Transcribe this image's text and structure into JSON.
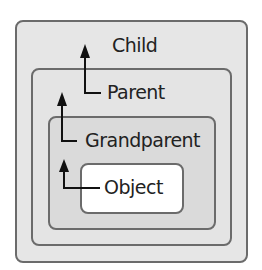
{
  "diagram": {
    "type": "nested-containment",
    "levels": [
      {
        "id": "child",
        "label": "Child"
      },
      {
        "id": "parent",
        "label": "Parent"
      },
      {
        "id": "grandparent",
        "label": "Grandparent"
      },
      {
        "id": "object",
        "label": "Object"
      }
    ],
    "arrows": [
      {
        "from": "Object",
        "to": "Grandparent"
      },
      {
        "from": "Grandparent",
        "to": "Parent"
      },
      {
        "from": "Parent",
        "to": "Child"
      }
    ],
    "colors": {
      "border": "#6b6b6b",
      "child_fill": "#e6e6e6",
      "parent_fill": "#e4e4e4",
      "grandparent_fill": "#dadada",
      "object_fill": "#ffffff",
      "arrow": "#111111",
      "text": "#222222"
    }
  }
}
